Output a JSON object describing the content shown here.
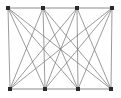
{
  "figure": {
    "background_color": "#ffffff",
    "width": 121,
    "height": 98
  },
  "style": {
    "node_color": "#2b2b2b",
    "node_size": 3.4,
    "node_shape": "square",
    "edge_color": "#7a7a7a",
    "rail_color": "#8a8a8a",
    "edge_width": 0.75,
    "rail_width": 1.0
  },
  "chart_data": {
    "type": "diagram",
    "graph_type": "node-link",
    "directed": false,
    "node_count": 8,
    "edge_count": 22,
    "parts": [
      {
        "name": "top",
        "node_ids": [
          "t1",
          "t2",
          "t3",
          "t4"
        ]
      },
      {
        "name": "bottom",
        "node_ids": [
          "b1",
          "b2",
          "b3",
          "b4"
        ]
      }
    ],
    "nodes": [
      {
        "id": "t1",
        "label": "",
        "row": "top",
        "x": 8,
        "y": 8
      },
      {
        "id": "t2",
        "label": "",
        "row": "top",
        "x": 43,
        "y": 8
      },
      {
        "id": "t3",
        "label": "",
        "row": "top",
        "x": 77,
        "y": 8
      },
      {
        "id": "t4",
        "label": "",
        "row": "top",
        "x": 112,
        "y": 8
      },
      {
        "id": "b1",
        "label": "",
        "row": "bottom",
        "x": 10,
        "y": 89
      },
      {
        "id": "b2",
        "label": "",
        "row": "bottom",
        "x": 45,
        "y": 89
      },
      {
        "id": "b3",
        "label": "",
        "row": "bottom",
        "x": 78,
        "y": 89
      },
      {
        "id": "b4",
        "label": "",
        "row": "bottom",
        "x": 111,
        "y": 89
      }
    ],
    "edges": [
      {
        "source": "t1",
        "target": "t2",
        "kind": "rail"
      },
      {
        "source": "t2",
        "target": "t3",
        "kind": "rail"
      },
      {
        "source": "t3",
        "target": "t4",
        "kind": "rail"
      },
      {
        "source": "b1",
        "target": "b2",
        "kind": "rail"
      },
      {
        "source": "b2",
        "target": "b3",
        "kind": "rail"
      },
      {
        "source": "b3",
        "target": "b4",
        "kind": "rail"
      },
      {
        "source": "t1",
        "target": "b1",
        "kind": "cross"
      },
      {
        "source": "t1",
        "target": "b2",
        "kind": "cross"
      },
      {
        "source": "t1",
        "target": "b3",
        "kind": "cross"
      },
      {
        "source": "t1",
        "target": "b4",
        "kind": "cross"
      },
      {
        "source": "t2",
        "target": "b1",
        "kind": "cross"
      },
      {
        "source": "t2",
        "target": "b2",
        "kind": "cross"
      },
      {
        "source": "t2",
        "target": "b3",
        "kind": "cross"
      },
      {
        "source": "t2",
        "target": "b4",
        "kind": "cross"
      },
      {
        "source": "t3",
        "target": "b1",
        "kind": "cross"
      },
      {
        "source": "t3",
        "target": "b2",
        "kind": "cross"
      },
      {
        "source": "t3",
        "target": "b3",
        "kind": "cross"
      },
      {
        "source": "t3",
        "target": "b4",
        "kind": "cross"
      },
      {
        "source": "t4",
        "target": "b1",
        "kind": "cross"
      },
      {
        "source": "t4",
        "target": "b2",
        "kind": "cross"
      },
      {
        "source": "t4",
        "target": "b3",
        "kind": "cross"
      },
      {
        "source": "t4",
        "target": "b4",
        "kind": "cross"
      }
    ],
    "xlim": [
      0,
      121
    ],
    "ylim": [
      0,
      98
    ],
    "grid": false,
    "legend": null,
    "annotations": []
  }
}
